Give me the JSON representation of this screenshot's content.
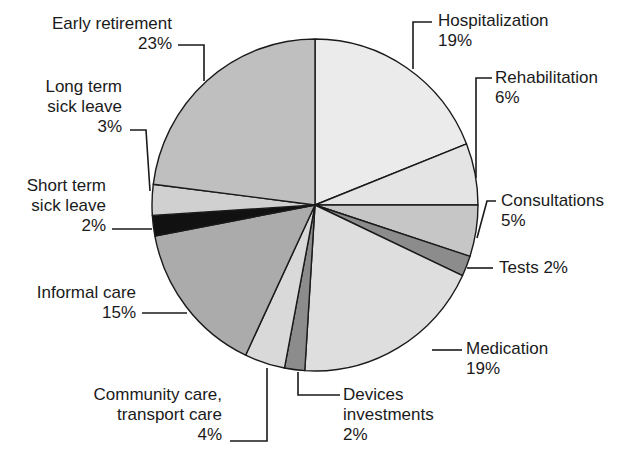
{
  "chart_data": {
    "type": "pie",
    "title": "",
    "start_angle_deg": 0,
    "direction": "clockwise",
    "slices": [
      {
        "label": "Hospitalization",
        "value": 19,
        "display": "19%",
        "color": "#ebebeb"
      },
      {
        "label": "Rehabilitation",
        "value": 6,
        "display": "6%",
        "color": "#e4e4e4"
      },
      {
        "label": "Consultations",
        "value": 5,
        "display": "5%",
        "color": "#c6c6c6"
      },
      {
        "label": "Tests",
        "value": 2,
        "display": "2%",
        "color": "#8c8c8c"
      },
      {
        "label": "Medication",
        "value": 19,
        "display": "19%",
        "color": "#dedede"
      },
      {
        "label": "Devices investments",
        "value": 2,
        "display": "2%",
        "color": "#8c8c8c"
      },
      {
        "label": "Community care, transport care",
        "value": 4,
        "display": "4%",
        "color": "#d9d9d9"
      },
      {
        "label": "Informal care",
        "value": 15,
        "display": "15%",
        "color": "#ababab"
      },
      {
        "label": "Short term sick leave",
        "value": 2,
        "display": "2%",
        "color": "#111111"
      },
      {
        "label": "Long term sick leave",
        "value": 3,
        "display": "3%",
        "color": "#d0d0d0"
      },
      {
        "label": "Early retirement",
        "value": 23,
        "display": "23%",
        "color": "#bfbfbf"
      }
    ]
  },
  "labels": {
    "hospitalization": {
      "name": "Hospitalization",
      "pct": "19%"
    },
    "rehabilitation": {
      "name": "Rehabilitation",
      "pct": "6%"
    },
    "consultations": {
      "name": "Consultations",
      "pct": "5%"
    },
    "tests": {
      "text": "Tests 2%"
    },
    "medication": {
      "name": "Medication",
      "pct": "19%"
    },
    "devices": {
      "line1": "Devices",
      "line2": "investments",
      "pct": "2%"
    },
    "community": {
      "line1": "Community care,",
      "line2": "transport care",
      "pct": "4%"
    },
    "informal": {
      "name": "Informal care",
      "pct": "15%"
    },
    "short_term": {
      "line1": "Short term",
      "line2": "sick leave",
      "pct": "2%"
    },
    "long_term": {
      "line1": "Long term",
      "line2": "sick leave",
      "pct": "3%"
    },
    "early": {
      "name": "Early retirement",
      "pct": "23%"
    }
  }
}
